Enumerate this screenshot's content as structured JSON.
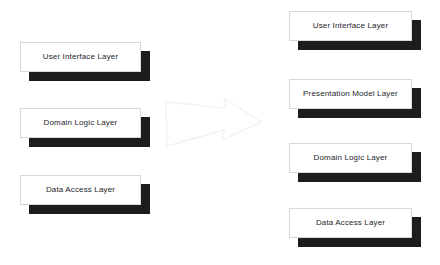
{
  "diagram": {
    "background_color": "#ffffff",
    "box_fill_color": "#ffffff",
    "box_border_color": "#d8d8d8",
    "shadow_color": "#1c1c1c",
    "text_color": "#26262a",
    "arrow_color": "#f2f2f2",
    "arrow": {
      "name": "transformation-arrow",
      "direction": "right"
    },
    "left_stack": {
      "name": "before-stack",
      "boxes": [
        {
          "label": "User Interface Layer",
          "x": 20,
          "y": 42,
          "w": 121,
          "h": 30
        },
        {
          "label": "Domain Logic Layer",
          "x": 20,
          "y": 108,
          "w": 121,
          "h": 30
        },
        {
          "label": "Data Access Layer",
          "x": 20,
          "y": 175,
          "w": 121,
          "h": 30
        }
      ]
    },
    "right_stack": {
      "name": "after-stack",
      "boxes": [
        {
          "label": "User Interface Layer",
          "x": 289,
          "y": 11,
          "w": 123,
          "h": 30
        },
        {
          "label": "Presentation Model Layer",
          "x": 289,
          "y": 79,
          "w": 123,
          "h": 30
        },
        {
          "label": "Domain Logic Layer",
          "x": 289,
          "y": 143,
          "w": 123,
          "h": 30
        },
        {
          "label": "Data Access Layer",
          "x": 289,
          "y": 208,
          "w": 123,
          "h": 30
        }
      ]
    }
  }
}
